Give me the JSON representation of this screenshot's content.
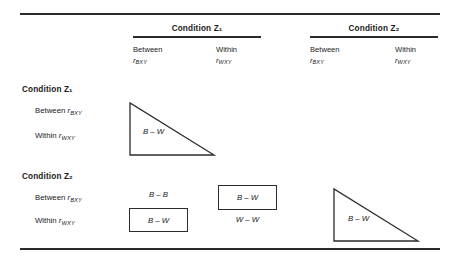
{
  "figure": {
    "column_header_groups": [
      {
        "label": "Condition Z₁"
      },
      {
        "label": "Condition Z₂"
      }
    ],
    "column_headers": [
      {
        "line1": "Between",
        "line2": "r",
        "sub": "BXY"
      },
      {
        "line1": "Within",
        "line2": "r",
        "sub": "WXY"
      },
      {
        "line1": "Between",
        "line2": "r",
        "sub": "BXY"
      },
      {
        "line1": "Within",
        "line2": "r",
        "sub": "WXY"
      }
    ],
    "row_header_groups": [
      {
        "label": "Condition Z₁"
      },
      {
        "label": "Condition Z₂"
      }
    ],
    "row_headers": [
      {
        "text": "Between ",
        "sym": "r",
        "sub": "BXY"
      },
      {
        "text": "Within ",
        "sym": "r",
        "sub": "WXY"
      },
      {
        "text": "Between ",
        "sym": "r",
        "sub": "BXY"
      },
      {
        "text": "Within ",
        "sym": "r",
        "sub": "WXY"
      }
    ],
    "cells": {
      "b_minus_b": "B – B",
      "b_minus_w_boxed_left": "B – W",
      "b_minus_w_boxed_right": "B – W",
      "w_minus_w": "W – W"
    },
    "triangles": [
      {
        "label": "B – W"
      },
      {
        "label": "B – W"
      }
    ],
    "colors": {
      "rule": "#2b2b2b",
      "text": "#1a1a1a",
      "background": "#ffffff",
      "box_border": "#2b2b2b",
      "triangle_stroke": "#2b2b2b"
    }
  }
}
